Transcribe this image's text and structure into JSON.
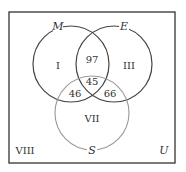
{
  "diagram": {
    "type": "venn",
    "universe_label": "U",
    "sets": [
      {
        "name": "M",
        "label": "M",
        "cx": 71,
        "cy": 64,
        "r": 38,
        "stroke": "#444444"
      },
      {
        "name": "E",
        "label": "E",
        "cx": 114,
        "cy": 64,
        "r": 38,
        "stroke": "#444444"
      },
      {
        "name": "S",
        "label": "S",
        "cx": 92,
        "cy": 113,
        "r": 37,
        "stroke": "#999999"
      }
    ],
    "regions": [
      {
        "id": "I",
        "label": "I",
        "x": 58,
        "y": 69
      },
      {
        "id": "II",
        "label": "97",
        "x": 92,
        "y": 63
      },
      {
        "id": "III",
        "label": "III",
        "x": 129,
        "y": 69
      },
      {
        "id": "IV",
        "label": "46",
        "x": 74,
        "y": 96
      },
      {
        "id": "V",
        "label": "45",
        "x": 92,
        "y": 84
      },
      {
        "id": "VI",
        "label": "66",
        "x": 110,
        "y": 96
      },
      {
        "id": "VII",
        "label": "VII",
        "x": 92,
        "y": 122
      },
      {
        "id": "VIII",
        "label": "VIII",
        "x": 25,
        "y": 154
      }
    ],
    "frame": {
      "x": 9,
      "y": 12,
      "width": 166,
      "height": 151,
      "stroke": "#333333"
    }
  }
}
